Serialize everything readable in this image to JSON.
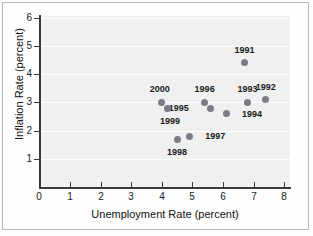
{
  "chart_data": {
    "type": "scatter",
    "title": "",
    "xlabel": "Unemployment Rate (percent)",
    "ylabel": "Inflation Rate (percent)",
    "xlim": [
      0,
      8
    ],
    "ylim": [
      0,
      6
    ],
    "xticks": [
      "0",
      "1",
      "2",
      "3",
      "4",
      "5",
      "6",
      "7",
      "8"
    ],
    "yticks": [
      "1",
      "2",
      "3",
      "4",
      "5",
      "6"
    ],
    "grid": true,
    "legend": "none",
    "point_labels": true,
    "points": [
      {
        "label": "1991",
        "x": 6.7,
        "y": 4.4,
        "label_dx": 0,
        "label_dy": -13
      },
      {
        "label": "1992",
        "x": 7.4,
        "y": 3.1,
        "label_dx": 0,
        "label_dy": -13
      },
      {
        "label": "1993",
        "x": 6.8,
        "y": 3.0,
        "label_dx": 0,
        "label_dy": -13
      },
      {
        "label": "1994",
        "x": 6.1,
        "y": 2.6,
        "label_dx": 22,
        "label_dy": 0
      },
      {
        "label": "1995",
        "x": 5.6,
        "y": 2.8,
        "label_dx": -22,
        "label_dy": 0
      },
      {
        "label": "1996",
        "x": 5.4,
        "y": 3.0,
        "label_dx": 0,
        "label_dy": -13
      },
      {
        "label": "1997",
        "x": 4.9,
        "y": 1.8,
        "label_dx": 22,
        "label_dy": 0
      },
      {
        "label": "1998",
        "x": 4.5,
        "y": 1.7,
        "label_dx": 0,
        "label_dy": 13
      },
      {
        "label": "1999",
        "x": 4.2,
        "y": 2.8,
        "label_dx": 2,
        "label_dy": 13
      },
      {
        "label": "2000",
        "x": 4.0,
        "y": 3.0,
        "label_dx": -2,
        "label_dy": -13
      }
    ],
    "colors": {
      "marker": "#7c7c86",
      "plot_background": "#f0f0f0",
      "gridline": "#ffffff",
      "axis": "#3a3a3a",
      "text": "#1a1a1a"
    }
  }
}
